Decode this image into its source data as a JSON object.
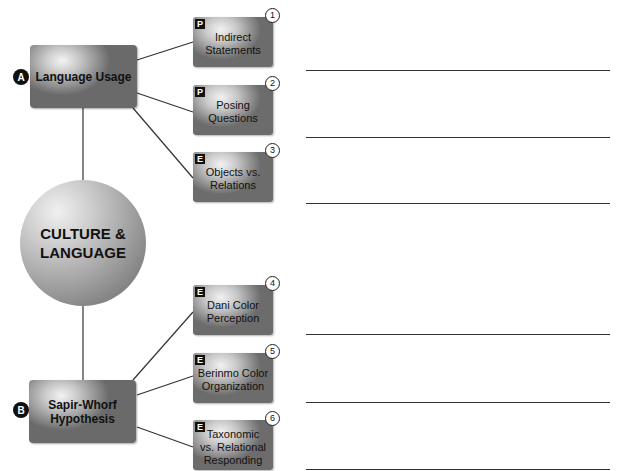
{
  "center": {
    "label": "CULTURE &\nLANGUAGE"
  },
  "branches": [
    {
      "badge": "A",
      "label": "Language Usage",
      "items": [
        {
          "tag": "P",
          "number": "1",
          "label": "Indirect\nStatements"
        },
        {
          "tag": "P",
          "number": "2",
          "label": "Posing\nQuestions"
        },
        {
          "tag": "E",
          "number": "3",
          "label": "Objects vs.\nRelations"
        }
      ]
    },
    {
      "badge": "B",
      "label": "Sapir-Whorf\nHypothesis",
      "items": [
        {
          "tag": "E",
          "number": "4",
          "label": "Dani Color\nPerception"
        },
        {
          "tag": "E",
          "number": "5",
          "label": "Berinmo Color\nOrganization"
        },
        {
          "tag": "E",
          "number": "6",
          "label": "Taxonomic\nvs. Relational\nResponding"
        }
      ]
    }
  ],
  "answer_lines": 6
}
